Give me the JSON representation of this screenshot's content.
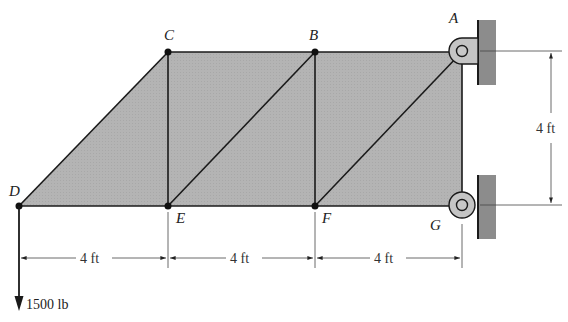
{
  "figure": {
    "type": "truss",
    "colors": {
      "panel_fill": "#b4b4b4",
      "wall_fill": "#8c8c8c",
      "member": "#1a1a1a",
      "text": "#222222"
    },
    "nodes": {
      "A": {
        "label": "A"
      },
      "B": {
        "label": "B"
      },
      "C": {
        "label": "C"
      },
      "D": {
        "label": "D"
      },
      "E": {
        "label": "E"
      },
      "F": {
        "label": "F"
      },
      "G": {
        "label": "G"
      }
    },
    "members": [
      "D-C",
      "C-B",
      "B-A",
      "D-E",
      "E-F",
      "F-G",
      "C-E",
      "B-F",
      "A-G",
      "E-B",
      "F-A"
    ],
    "supports": {
      "A": "pin",
      "G": "pin"
    },
    "dimensions": {
      "horizontal": [
        "4 ft",
        "4 ft",
        "4 ft"
      ],
      "vertical": "4 ft"
    },
    "load": {
      "node": "D",
      "direction": "down",
      "label": "1500 lb"
    }
  }
}
